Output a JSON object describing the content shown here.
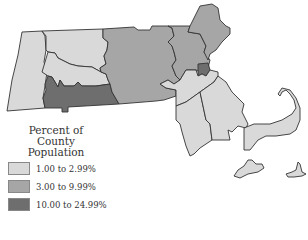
{
  "map": {
    "title": "Massachusetts county population share",
    "colors": {
      "low": "#d9d9d9",
      "mid": "#a6a6a6",
      "high": "#6e6e6e",
      "border": "#333333"
    },
    "counties": [
      {
        "name": "Berkshire",
        "class": "low"
      },
      {
        "name": "Franklin",
        "class": "low"
      },
      {
        "name": "Hampshire",
        "class": "low"
      },
      {
        "name": "Hampden",
        "class": "high"
      },
      {
        "name": "Worcester",
        "class": "mid"
      },
      {
        "name": "Middlesex",
        "class": "mid"
      },
      {
        "name": "Essex",
        "class": "mid"
      },
      {
        "name": "Suffolk",
        "class": "high"
      },
      {
        "name": "Norfolk",
        "class": "low"
      },
      {
        "name": "Bristol",
        "class": "low"
      },
      {
        "name": "Plymouth",
        "class": "low"
      },
      {
        "name": "Barnstable",
        "class": "low"
      },
      {
        "name": "Dukes",
        "class": "low"
      },
      {
        "name": "Nantucket",
        "class": "low"
      }
    ]
  },
  "legend": {
    "title_line1": "Percent of",
    "title_line2": "County Population",
    "items": [
      {
        "label": "1.00 to 2.99%",
        "color": "#d9d9d9"
      },
      {
        "label": "3.00 to 9.99%",
        "color": "#a6a6a6"
      },
      {
        "label": "10.00 to 24.99%",
        "color": "#6e6e6e"
      }
    ]
  }
}
